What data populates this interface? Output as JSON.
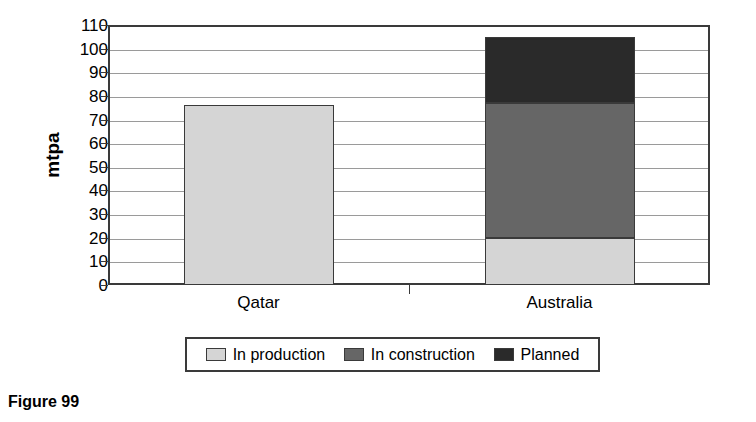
{
  "chart_data": {
    "type": "bar",
    "subtype": "stacked-vertical",
    "title": "",
    "xlabel": "",
    "ylabel": "mtpa",
    "ylim": [
      0,
      110
    ],
    "ytick_step": 10,
    "yticks": [
      110,
      100,
      90,
      80,
      70,
      60,
      50,
      40,
      30,
      20,
      10,
      0
    ],
    "grid": true,
    "grid_axis": "y",
    "legend_position": "bottom",
    "categories": [
      "Qatar",
      "Australia"
    ],
    "series": [
      {
        "name": "In production",
        "color": "#d5d5d5",
        "values": [
          76,
          20
        ]
      },
      {
        "name": "In construction",
        "color": "#666666",
        "values": [
          0,
          57
        ]
      },
      {
        "name": "Planned",
        "color": "#2a2a2a",
        "values": [
          0,
          28
        ]
      }
    ],
    "totals": [
      76,
      105
    ],
    "annotations": []
  },
  "figure": {
    "caption": "Figure 99"
  },
  "legend": {
    "entries": [
      {
        "label": "In production"
      },
      {
        "label": "In construction"
      },
      {
        "label": "Planned"
      }
    ]
  },
  "axis": {
    "y_title": "mtpa"
  }
}
